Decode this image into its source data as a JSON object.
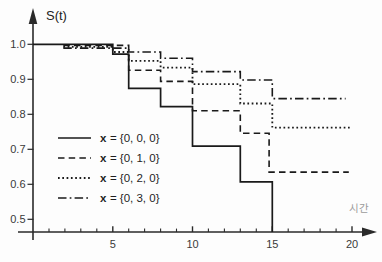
{
  "figure": {
    "background": "#fdfdfd"
  },
  "chart_data": {
    "type": "line",
    "subtype": "step-survival-curves",
    "title": "",
    "ylabel": "S(t)",
    "xlabel": "시간",
    "xlim": [
      0,
      21
    ],
    "ylim": [
      0.46,
      1.04
    ],
    "grid": false,
    "legend_position": "lower-left",
    "x_ticks_major": [
      5,
      10,
      15,
      20
    ],
    "x_tick_labels": [
      "5",
      "10",
      "15",
      "20"
    ],
    "x_ticks_minor": [
      1,
      2,
      3,
      4,
      6,
      7,
      8,
      9,
      11,
      12,
      13,
      14,
      16,
      17,
      18,
      19
    ],
    "y_ticks": [
      1.0,
      0.9,
      0.8,
      0.7,
      0.6,
      0.5
    ],
    "y_tick_labels": [
      "1.0",
      "0.9",
      "0.8",
      "0.7",
      "0.6",
      "0.5"
    ],
    "colors": {
      "curve": "#1a1a1a",
      "axis": "#2a2a2a",
      "tick_label": "#3a3a3a",
      "legend_text": "#1f1f1f",
      "ylabel": "#222222",
      "xlabel": "#9b9b9b"
    },
    "series": [
      {
        "name": "x = {0, 0, 0}",
        "line_style": "solid",
        "dash": "",
        "stroke_width": 1.7,
        "points": [
          [
            0,
            1.0
          ],
          [
            5,
            1.0
          ],
          [
            5,
            0.972
          ],
          [
            6,
            0.972
          ],
          [
            6,
            0.874
          ],
          [
            8,
            0.874
          ],
          [
            8,
            0.822
          ],
          [
            10,
            0.822
          ],
          [
            10,
            0.709
          ],
          [
            13,
            0.709
          ],
          [
            13,
            0.607
          ],
          [
            15,
            0.607
          ],
          [
            15,
            0.464
          ]
        ]
      },
      {
        "name": "x = {0, 1, 0}",
        "line_style": "dashed",
        "dash": "6.5 4.2",
        "stroke_width": 1.6,
        "points": [
          [
            1.9,
            0.997
          ],
          [
            6,
            0.997
          ],
          [
            6,
            0.926
          ],
          [
            8,
            0.926
          ],
          [
            8,
            0.894
          ],
          [
            10,
            0.894
          ],
          [
            10,
            0.81
          ],
          [
            13,
            0.81
          ],
          [
            13,
            0.746
          ],
          [
            14.8,
            0.746
          ],
          [
            14.8,
            0.635
          ],
          [
            19.8,
            0.635
          ]
        ]
      },
      {
        "name": "x = {0, 2, 0}",
        "line_style": "dotted",
        "dash": "1.7 2.6",
        "stroke_width": 1.8,
        "points": [
          [
            1.9,
            0.993
          ],
          [
            5,
            0.993
          ],
          [
            5,
            0.978
          ],
          [
            6,
            0.978
          ],
          [
            6,
            0.953
          ],
          [
            8,
            0.953
          ],
          [
            8,
            0.933
          ],
          [
            10,
            0.933
          ],
          [
            10,
            0.886
          ],
          [
            13,
            0.886
          ],
          [
            13,
            0.831
          ],
          [
            15,
            0.831
          ],
          [
            15,
            0.762
          ],
          [
            19.9,
            0.762
          ]
        ]
      },
      {
        "name": "x = {0, 3, 0}",
        "line_style": "dashdot",
        "dash": "8.5 3.2 1.7 3.2",
        "stroke_width": 1.6,
        "points": [
          [
            1.9,
            0.989
          ],
          [
            6,
            0.989
          ],
          [
            6,
            0.978
          ],
          [
            8,
            0.978
          ],
          [
            8,
            0.96
          ],
          [
            10,
            0.96
          ],
          [
            10,
            0.922
          ],
          [
            13,
            0.922
          ],
          [
            13,
            0.898
          ],
          [
            15,
            0.898
          ],
          [
            15,
            0.845
          ],
          [
            19.6,
            0.845
          ]
        ]
      }
    ],
    "legend": [
      {
        "x_part": "x",
        "value_part": "= {0, 0, 0}",
        "line_style": "solid"
      },
      {
        "x_part": "x",
        "value_part": "= {0, 1, 0}",
        "line_style": "dashed"
      },
      {
        "x_part": "x",
        "value_part": "= {0, 2, 0}",
        "line_style": "dotted"
      },
      {
        "x_part": "x",
        "value_part": "= {0, 3, 0}",
        "line_style": "dashdot"
      }
    ]
  }
}
